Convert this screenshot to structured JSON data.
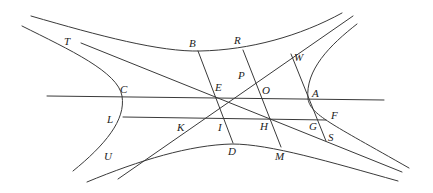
{
  "figure": {
    "type": "geometric-diagram",
    "stroke_color": "#3a3a3a",
    "label_color": "#222222",
    "background": "#ffffff"
  },
  "labels": {
    "T": "T",
    "B": "B",
    "R": "R",
    "W": "W",
    "P": "P",
    "C": "C",
    "E": "E",
    "O": "O",
    "A": "A",
    "L": "L",
    "K": "K",
    "I": "I",
    "H": "H",
    "G": "G",
    "F": "F",
    "S": "S",
    "U": "U",
    "D": "D",
    "M": "M"
  },
  "points": {
    "E": [
      210,
      97
    ],
    "C": [
      123,
      96
    ],
    "O": [
      258,
      98
    ],
    "A": [
      308,
      99
    ],
    "B": [
      198,
      51
    ],
    "R": [
      243,
      50
    ],
    "W": [
      290,
      54
    ],
    "P": [
      250,
      72
    ],
    "L": [
      123,
      117
    ],
    "K": [
      180,
      118
    ],
    "I": [
      222,
      118
    ],
    "H": [
      270,
      119
    ],
    "G": [
      318,
      120
    ],
    "F": [
      326,
      120
    ],
    "S": [
      326,
      141
    ],
    "U": [
      118,
      179
    ],
    "D": [
      230,
      143
    ],
    "M": [
      280,
      147
    ],
    "T": [
      81,
      43
    ]
  },
  "curves": {
    "upper_branch": "upper conjugate hyperbola through B and R",
    "lower_branch": "lower conjugate hyperbola through D and M",
    "left_branch": "left hyperbola branch through C and L",
    "right_branch": "right hyperbola branch through A and F"
  },
  "lines": {
    "transverse_axis": "C–E–O–A",
    "ordinate": "L–K–I–H–G–F",
    "asymptote_1": "T–E–H–S",
    "asymptote_2": "U–K–E–P–W",
    "diameter_1": "B–E–I–D",
    "diameter_2": "R–P–O–H–M",
    "diameter_3": "W–A–G–S"
  }
}
